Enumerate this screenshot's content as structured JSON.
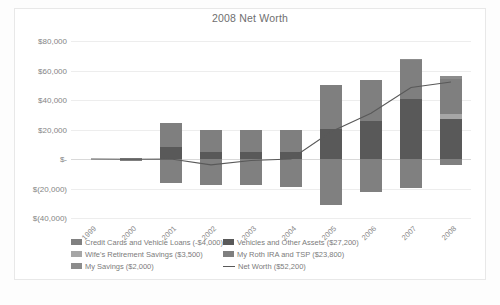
{
  "chart_data": {
    "type": "bar",
    "subtype": "stacked-column-with-line-overlay",
    "title": "2008 Net Worth",
    "xlabel": "",
    "ylabel": "",
    "categories": [
      "1999",
      "2000",
      "2001",
      "2002",
      "2003",
      "2004",
      "2005",
      "2006",
      "2007",
      "2008"
    ],
    "ylim": [
      -40000,
      80000
    ],
    "yticks": [
      80000,
      60000,
      40000,
      20000,
      0,
      -20000,
      -40000
    ],
    "ytick_labels": [
      "$80,000",
      "$60,000",
      "$40,000",
      "$20,000",
      "$-",
      "$(20,000)",
      "$(40,000)"
    ],
    "grid": true,
    "legend_position": "bottom",
    "series": [
      {
        "name": "Credit Cards and Vehicle Loans (-$4,000)",
        "legend_label": "Credit Cards and Vehicle Loans (-$4,000)",
        "value_2008": -4000,
        "color": "#808080",
        "values": [
          0,
          -1200,
          -16500,
          -17500,
          -17500,
          -19000,
          -31500,
          -22500,
          -19500,
          -4000
        ]
      },
      {
        "name": "Vehicles and Other Assets ($27,200)",
        "legend_label": "Vehicles and Other Assets ($27,200)",
        "value_2008": 27200,
        "color": "#595959",
        "values": [
          0,
          0,
          8000,
          4500,
          4500,
          4500,
          20500,
          26000,
          40500,
          27200
        ]
      },
      {
        "name": "Wife's Retirement Savings ($3,500)",
        "legend_label": "Wife's Retirement Savings ($3,500)",
        "value_2008": 3500,
        "color": "#a6a6a6",
        "values": [
          0,
          0,
          0,
          0,
          0,
          0,
          0,
          0,
          0,
          3500
        ]
      },
      {
        "name": "My Roth IRA and TSP ($23,800)",
        "legend_label": "My Roth IRA and TSP ($23,800)",
        "value_2008": 23800,
        "color": "#7f7f7f",
        "values": [
          0,
          1000,
          16500,
          15500,
          15500,
          15000,
          29500,
          27500,
          26500,
          23800
        ]
      },
      {
        "name": "My Savings ($2,000)",
        "legend_label": "My Savings ($2,000)",
        "value_2008": 2000,
        "color": "#8c8c8c",
        "values": [
          0,
          0,
          0,
          0,
          0,
          0,
          0,
          0,
          1000,
          2000
        ]
      }
    ],
    "line_series": {
      "name": "Net Worth ($52,200)",
      "legend_label": "Net Worth ($52,200)",
      "color": "#595959",
      "values": [
        0,
        -200,
        0,
        -4000,
        -1000,
        0,
        18500,
        31000,
        48500,
        52200
      ]
    }
  },
  "legend": {
    "rows": [
      [
        {
          "label": "Credit Cards and Vehicle Loans (-$4,000)",
          "color": "#808080",
          "marker": "box"
        },
        {
          "label": "Vehicles and Other Assets ($27,200)",
          "color": "#595959",
          "marker": "box"
        }
      ],
      [
        {
          "label": "Wife's Retirement Savings ($3,500)",
          "color": "#a6a6a6",
          "marker": "box"
        },
        {
          "label": "My Roth IRA and TSP ($23,800)",
          "color": "#7f7f7f",
          "marker": "box"
        }
      ],
      [
        {
          "label": "My Savings ($2,000)",
          "color": "#8c8c8c",
          "marker": "box"
        },
        {
          "label": "Net Worth ($52,200)",
          "color": "#595959",
          "marker": "line"
        }
      ]
    ]
  }
}
